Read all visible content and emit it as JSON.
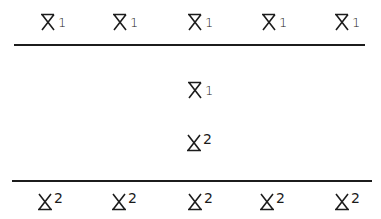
{
  "figure": {
    "top_row": [
      {
        "base": "X",
        "mark": "overbar",
        "index": "1"
      },
      {
        "base": "X",
        "mark": "overbar",
        "index": "1"
      },
      {
        "base": "X",
        "mark": "overbar",
        "index": "1"
      },
      {
        "base": "X",
        "mark": "overbar",
        "index": "1"
      },
      {
        "base": "X",
        "mark": "overbar",
        "index": "1"
      }
    ],
    "middle": [
      {
        "base": "X",
        "mark": "overbar",
        "index": "1"
      },
      {
        "base": "X",
        "mark": "underbar",
        "index": "2"
      }
    ],
    "bottom_row": [
      {
        "base": "X",
        "mark": "underbar",
        "index": "2"
      },
      {
        "base": "X",
        "mark": "underbar",
        "index": "2"
      },
      {
        "base": "X",
        "mark": "underbar",
        "index": "2"
      },
      {
        "base": "X",
        "mark": "underbar",
        "index": "2"
      },
      {
        "base": "X",
        "mark": "underbar",
        "index": "2"
      }
    ],
    "colors": {
      "ink": "#1c1c1c",
      "background": "#ffffff"
    }
  }
}
